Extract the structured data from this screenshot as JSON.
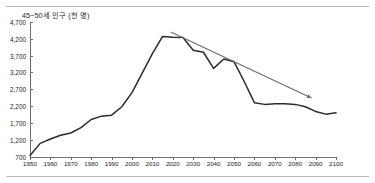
{
  "chart_data": {
    "type": "line",
    "title": "45~50세 인구 (천 명)",
    "xlabel": "",
    "ylabel": "",
    "xlim": [
      1950,
      2100
    ],
    "ylim": [
      700,
      4700
    ],
    "ytick_step": 500,
    "xtick_step": 10,
    "grid": false,
    "legend": "none",
    "yticks": [
      "4,700",
      "4,200",
      "3,700",
      "3,200",
      "2,700",
      "2,200",
      "1,700",
      "1,200",
      "700"
    ],
    "ytick_values": [
      4700,
      4200,
      3700,
      3200,
      2700,
      2200,
      1700,
      1200,
      700
    ],
    "xticks": [
      "1950",
      "1960",
      "1970",
      "1980",
      "1990",
      "2000",
      "2010",
      "2020",
      "2030",
      "2040",
      "2050",
      "2060",
      "2070",
      "2080",
      "2090",
      "2100"
    ],
    "xtick_values": [
      1950,
      1960,
      1970,
      1980,
      1990,
      2000,
      2010,
      2020,
      2030,
      2040,
      2050,
      2060,
      2070,
      2080,
      2090,
      2100
    ],
    "series": [
      {
        "name": "45~50세 인구",
        "color": "#2b2b2b",
        "x": [
          1950,
          1955,
          1960,
          1965,
          1970,
          1975,
          1980,
          1985,
          1990,
          1995,
          2000,
          2005,
          2010,
          2015,
          2020,
          2025,
          2030,
          2035,
          2040,
          2045,
          2050,
          2055,
          2060,
          2065,
          2070,
          2075,
          2080,
          2085,
          2090,
          2095,
          2100
        ],
        "values": [
          730,
          1090,
          1220,
          1330,
          1400,
          1560,
          1800,
          1900,
          1930,
          2180,
          2600,
          3180,
          3760,
          4270,
          4250,
          4240,
          3860,
          3800,
          3320,
          3600,
          3520,
          2930,
          2300,
          2250,
          2270,
          2270,
          2250,
          2180,
          2040,
          1960,
          2000
        ]
      }
    ],
    "annotations": [
      {
        "name": "decline-trend-arrow",
        "type": "arrow",
        "color": "#6b6b6b",
        "x_start": 2019,
        "y_start": 4400,
        "x_end": 2088,
        "y_end": 2440
      }
    ]
  }
}
